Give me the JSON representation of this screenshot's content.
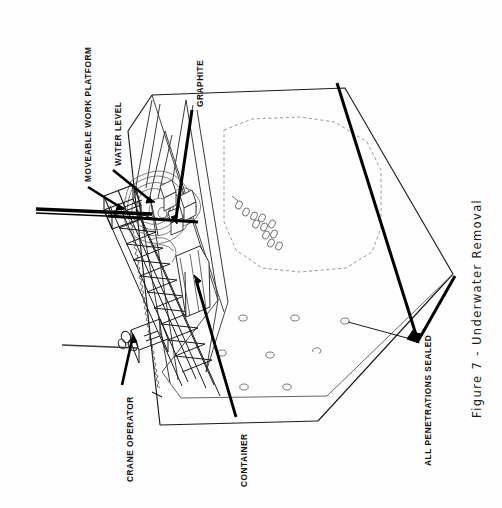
{
  "figure": {
    "caption": "Figure 7  -  Underwater Removal",
    "orientation": "rotated-90-ccw",
    "background_color": "#fefefe",
    "line_color": "#1a1a1a",
    "dashed_color": "#999999",
    "thick_leader_color": "#000000"
  },
  "labels": {
    "moveable_work_platform": "MOVEABLE WORK PLATFORM",
    "water_level": "WATER LEVEL",
    "graphite": "GRAPHITE",
    "crane_operator": "CRANE OPERATOR",
    "container": "CONTAINER",
    "all_penetrations_sealed": "ALL PENETRATIONS SEALED"
  },
  "diagram_elements": {
    "vessel": "isometric open-top rectangular pool enclosure",
    "inner_dashed_outline": "dashed hexagonal boundary on back wall",
    "penetration_holes_floor": 8,
    "penetration_holes_cluster": 11,
    "work_platform": "truss scaffolding bridge spanning the pool",
    "container_box": "upright rectangular container inside pool",
    "water_ripples": "concentric contour ripples at removal point"
  }
}
